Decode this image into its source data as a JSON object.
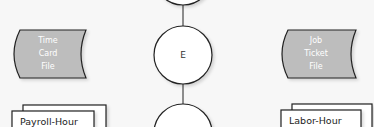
{
  "diagram": {
    "colors": {
      "background": "#f7f7f7",
      "file_fill": "#bdbdbd",
      "stroke": "#222222",
      "file_text": "#ffffff"
    },
    "files": [
      {
        "lines": [
          "Time",
          "Card",
          "File"
        ]
      },
      {
        "lines": [
          "Job",
          "Ticket",
          "File"
        ]
      }
    ],
    "nodes": [
      {
        "label": ""
      },
      {
        "label": "E"
      },
      {
        "label": ""
      }
    ],
    "documents": [
      {
        "label": "Payroll-Hour"
      },
      {
        "label": "Labor-Hour"
      }
    ]
  }
}
